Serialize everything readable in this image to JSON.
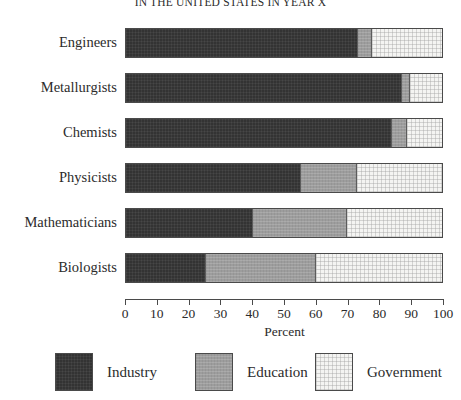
{
  "chart_data": {
    "type": "bar",
    "orientation": "horizontal",
    "stacked": true,
    "stack_mode": "percent",
    "title": "IN THE UNITED STATES IN YEAR X",
    "xlabel": "Percent",
    "ylabel": "",
    "xlim": [
      0,
      100
    ],
    "xticks": [
      0,
      10,
      20,
      30,
      40,
      50,
      60,
      70,
      80,
      90,
      100
    ],
    "xtick_labels": [
      "0",
      "10",
      "20",
      "30",
      "40",
      "50",
      "60",
      "70",
      "80",
      "90",
      "100"
    ],
    "grid": false,
    "legend_position": "bottom",
    "categories": [
      "Engineers",
      "Metallurgists",
      "Chemists",
      "Physicists",
      "Mathematicians",
      "Biologists"
    ],
    "series": [
      {
        "name": "Industry",
        "color": "#333333",
        "values": [
          73,
          87,
          84,
          55,
          40,
          25
        ]
      },
      {
        "name": "Education",
        "color": "#9d9d9d",
        "values": [
          5,
          3,
          5,
          18,
          30,
          35
        ]
      },
      {
        "name": "Government",
        "color": "#f4f4f2",
        "values": [
          22,
          10,
          11,
          27,
          30,
          40
        ]
      }
    ],
    "legend_entries": [
      {
        "label": "Industry",
        "color": "#333333"
      },
      {
        "label": "Education",
        "color": "#9d9d9d"
      },
      {
        "label": "Government",
        "color": "#f4f4f2"
      }
    ]
  }
}
